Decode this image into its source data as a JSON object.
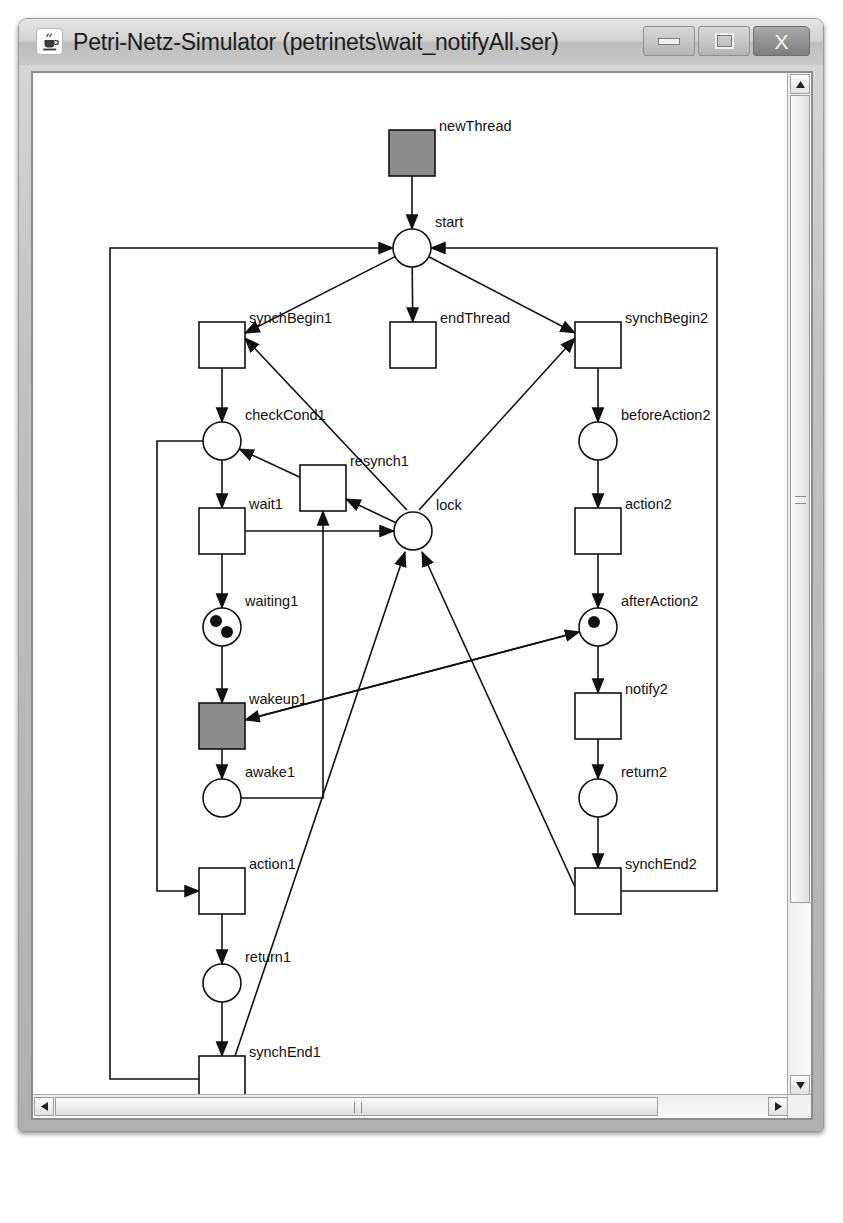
{
  "window": {
    "title": "Petri-Netz-Simulator (petrinets\\wait_notifyAll.ser)",
    "app_icon": "java-coffee-cup-icon",
    "buttons": {
      "minimize": "minimize-icon",
      "maximize": "maximize-icon",
      "close": "X"
    }
  },
  "scrollbars": {
    "vertical": {
      "up": "▲",
      "down": "▼"
    },
    "horizontal": {
      "left": "◀",
      "right": "▶"
    }
  },
  "colors": {
    "enabled_transition_fill": "#8c8c8c",
    "transition_fill": "#ffffff",
    "stroke": "#111111",
    "token": "#111111",
    "canvas": "#ffffff"
  },
  "chart_data": {
    "type": "diagram",
    "diagram_kind": "petri-net",
    "title": "wait_notifyAll",
    "places": [
      {
        "id": "start",
        "label": "start",
        "cx": 405,
        "cy": 235,
        "r": 19,
        "tokens": 0
      },
      {
        "id": "checkCond1",
        "label": "checkCond1",
        "cx": 215,
        "cy": 428,
        "r": 19,
        "tokens": 0
      },
      {
        "id": "waiting1",
        "label": "waiting1",
        "cx": 215,
        "cy": 614,
        "r": 19,
        "tokens": 2
      },
      {
        "id": "awake1",
        "label": "awake1",
        "cx": 215,
        "cy": 785,
        "r": 19,
        "tokens": 0
      },
      {
        "id": "return1",
        "label": "return1",
        "cx": 215,
        "cy": 970,
        "r": 19,
        "tokens": 0
      },
      {
        "id": "lock",
        "label": "lock",
        "cx": 406,
        "cy": 518,
        "r": 19,
        "tokens": 0
      },
      {
        "id": "beforeAction2",
        "label": "beforeAction2",
        "cx": 591,
        "cy": 428,
        "r": 19,
        "tokens": 0
      },
      {
        "id": "afterAction2",
        "label": "afterAction2",
        "cx": 591,
        "cy": 614,
        "r": 19,
        "tokens": 1
      },
      {
        "id": "return2",
        "label": "return2",
        "cx": 591,
        "cy": 785,
        "r": 19,
        "tokens": 0
      }
    ],
    "transitions": [
      {
        "id": "newThread",
        "label": "newThread",
        "x": 382,
        "y": 117,
        "w": 46,
        "h": 46,
        "enabled": true
      },
      {
        "id": "synchBegin1",
        "label": "synchBegin1",
        "x": 192,
        "y": 309,
        "w": 46,
        "h": 46,
        "enabled": false
      },
      {
        "id": "endThread",
        "label": "endThread",
        "x": 383,
        "y": 309,
        "w": 46,
        "h": 46,
        "enabled": false
      },
      {
        "id": "synchBegin2",
        "label": "synchBegin2",
        "x": 568,
        "y": 309,
        "w": 46,
        "h": 46,
        "enabled": false
      },
      {
        "id": "wait1",
        "label": "wait1",
        "x": 192,
        "y": 495,
        "w": 46,
        "h": 46,
        "enabled": false
      },
      {
        "id": "resynch1",
        "label": "resynch1",
        "x": 293,
        "y": 452,
        "w": 46,
        "h": 46,
        "enabled": false
      },
      {
        "id": "action2",
        "label": "action2",
        "x": 568,
        "y": 495,
        "w": 46,
        "h": 46,
        "enabled": false
      },
      {
        "id": "wakeup1",
        "label": "wakeup1",
        "x": 192,
        "y": 690,
        "w": 46,
        "h": 46,
        "enabled": true
      },
      {
        "id": "notify2",
        "label": "notify2",
        "x": 568,
        "y": 680,
        "w": 46,
        "h": 46,
        "enabled": false
      },
      {
        "id": "action1",
        "label": "action1",
        "x": 192,
        "y": 855,
        "w": 46,
        "h": 46,
        "enabled": false
      },
      {
        "id": "synchEnd2",
        "label": "synchEnd2",
        "x": 568,
        "y": 855,
        "w": 46,
        "h": 46,
        "enabled": false
      },
      {
        "id": "synchEnd1",
        "label": "synchEnd1",
        "x": 192,
        "y": 1043,
        "w": 46,
        "h": 46,
        "enabled": false
      }
    ],
    "arcs": [
      "newThread->start",
      "start->synchBegin1",
      "start->endThread",
      "start->synchBegin2",
      "synchBegin1->checkCond1",
      "checkCond1->wait1",
      "wait1->waiting1",
      "wait1->lock",
      "waiting1->wakeup1",
      "wakeup1->awake1",
      "awake1->resynch1",
      "resynch1->checkCond1",
      "lock->resynch1",
      "checkCond1->action1",
      "action1->return1",
      "return1->synchEnd1",
      "synchEnd1->start",
      "synchEnd1->lock",
      "synchBegin2->beforeAction2",
      "beforeAction2->action2",
      "action2->afterAction2",
      "afterAction2->notify2",
      "notify2->return2",
      "return2->synchEnd2",
      "synchEnd2->start",
      "synchEnd2->lock",
      "afterAction2->wakeup1",
      "wakeup1->afterAction2",
      "lock->synchBegin1",
      "lock->synchBegin2"
    ]
  }
}
